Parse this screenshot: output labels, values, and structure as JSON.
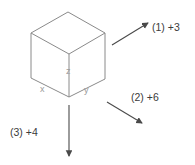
{
  "figure": {
    "background_color": "#ffffff",
    "cube_line_color": "#8a8a8a",
    "arrow_color": "#555555",
    "vertex_label_color": "#9a9a9a",
    "annotation_label_color": "#3b3b3b"
  },
  "cube": {
    "name": "cube",
    "vertex_labels": {
      "x": "x",
      "y": "y",
      "z": "z"
    }
  },
  "annotations": [
    {
      "id": "1",
      "label": "(1) +3",
      "index": "(1)",
      "value": "+3",
      "direction": "up-right"
    },
    {
      "id": "2",
      "label": "(2) +6",
      "index": "(2)",
      "value": "+6",
      "direction": "down-right"
    },
    {
      "id": "3",
      "label": "(3) +4",
      "index": "(3)",
      "value": "+4",
      "direction": "down"
    }
  ]
}
